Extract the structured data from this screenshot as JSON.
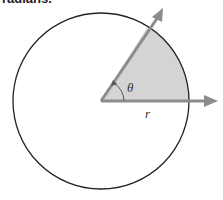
{
  "header": {
    "cropped_text": "radians."
  },
  "diagram": {
    "labels": {
      "angle": "θ",
      "radius": "r"
    },
    "colors": {
      "sector_fill": "#d4d4d4",
      "arrow": "#8c8c8c",
      "circle": "#222222"
    }
  }
}
